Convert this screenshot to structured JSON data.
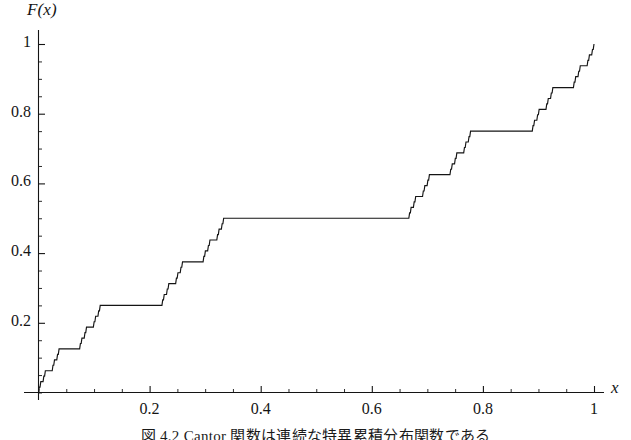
{
  "figure": {
    "caption": "図 4.2  Cantor 関数は連続な特異累積分布関数である",
    "background": "#ffffff",
    "line_color": "#141414"
  },
  "chart_data": {
    "type": "line",
    "title": "",
    "xlabel": "x",
    "ylabel": "F(x)",
    "xlim": [
      0,
      1.02
    ],
    "ylim": [
      0,
      1.02
    ],
    "grid": false,
    "legend": null,
    "x_ticks_major": [
      0.2,
      0.4,
      0.6,
      0.8,
      1
    ],
    "x_ticklabels": [
      "0.2",
      "0.4",
      "0.6",
      "0.8",
      "1"
    ],
    "y_ticks_major": [
      0.2,
      0.4,
      0.6,
      0.8,
      1
    ],
    "y_ticklabels": [
      "0.2",
      "0.4",
      "0.6",
      "0.8",
      "1"
    ],
    "x_minor_step": 0.05,
    "y_minor_step": 0.05,
    "plateaus": [
      {
        "x0": 0.33333,
        "x1": 0.66667,
        "y": 0.5
      },
      {
        "x0": 0.11111,
        "x1": 0.22222,
        "y": 0.25
      },
      {
        "x0": 0.77778,
        "x1": 0.88889,
        "y": 0.75
      },
      {
        "x0": 0.03704,
        "x1": 0.07407,
        "y": 0.125
      },
      {
        "x0": 0.25926,
        "x1": 0.2963,
        "y": 0.375
      },
      {
        "x0": 0.7037,
        "x1": 0.74074,
        "y": 0.625
      },
      {
        "x0": 0.92593,
        "x1": 0.96296,
        "y": 0.875
      }
    ],
    "endpoints": [
      {
        "x": 0,
        "y": 0
      },
      {
        "x": 1,
        "y": 1
      }
    ],
    "recursion_depth": 6
  }
}
